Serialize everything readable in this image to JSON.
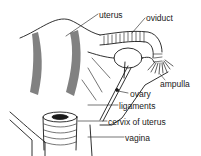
{
  "diagram": {
    "type": "anatomical-illustration",
    "labels": [
      {
        "id": "uterus",
        "text": "uterus",
        "x": 99,
        "y": 11
      },
      {
        "id": "oviduct",
        "text": "oviduct",
        "x": 146,
        "y": 14
      },
      {
        "id": "ampulla",
        "text": "ampulla",
        "x": 160,
        "y": 80
      },
      {
        "id": "ovary",
        "text": "ovary",
        "x": 130,
        "y": 90
      },
      {
        "id": "ligaments",
        "text": "ligaments",
        "x": 119,
        "y": 102
      },
      {
        "id": "cervix",
        "text": "cervix of uterus",
        "x": 108,
        "y": 118
      },
      {
        "id": "vagina",
        "text": "vagina",
        "x": 125,
        "y": 134
      }
    ],
    "colors": {
      "ink": "#1a1a1a",
      "background": "#ffffff"
    }
  }
}
